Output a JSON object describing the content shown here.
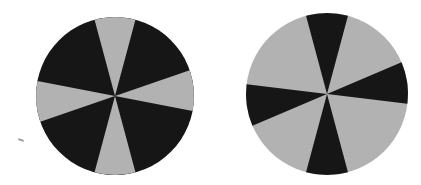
{
  "figure": {
    "colors": {
      "dark": "#161616",
      "light": "#b2b2b2",
      "background": "#ffffff"
    },
    "circles": [
      {
        "name": "left-circle",
        "cx": 115,
        "cy": 96,
        "r": 79,
        "narrow_color": "light",
        "wide_color": "dark",
        "narrow_half_angle_deg": 15,
        "narrow_axes_deg": [
          -90,
          -4,
          90,
          176
        ]
      },
      {
        "name": "right-circle",
        "cx": 327,
        "cy": 94,
        "r": 81,
        "narrow_color": "dark",
        "wide_color": "light",
        "narrow_half_angle_deg": 15,
        "narrow_axes_deg": [
          -90,
          -8,
          90,
          172
        ]
      }
    ]
  }
}
